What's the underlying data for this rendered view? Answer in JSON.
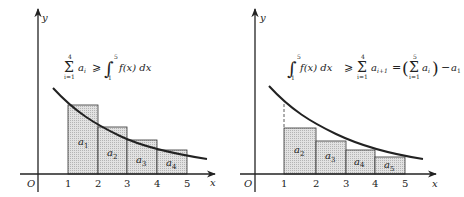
{
  "colors": {
    "ink": "#222222",
    "fill": "#d8d8d8",
    "background": "#ffffff"
  },
  "left_panel": {
    "axis_labels": {
      "x": "x",
      "y": "y",
      "origin": "O"
    },
    "x_ticks": [
      "1",
      "2",
      "3",
      "4",
      "5"
    ],
    "formula": {
      "sum_upper": "4",
      "sum_lower": "i=1",
      "sum_symbol": "Σ",
      "sum_term": "a",
      "sum_term_sub": "i",
      "relation": "⩾",
      "integral_symbol": "∫",
      "int_upper": "5",
      "int_lower": "1",
      "integrand": "f(x) dx"
    },
    "rectangles": [
      {
        "label": "a",
        "sub": "1"
      },
      {
        "label": "a",
        "sub": "2"
      },
      {
        "label": "a",
        "sub": "3"
      },
      {
        "label": "a",
        "sub": "4"
      }
    ]
  },
  "right_panel": {
    "axis_labels": {
      "x": "x",
      "y": "y",
      "origin": "O"
    },
    "x_ticks": [
      "1",
      "2",
      "3",
      "4",
      "5"
    ],
    "formula": {
      "integral_symbol": "∫",
      "int_upper": "5",
      "int_lower": "1",
      "integrand": "f(x) dx",
      "relation": "⩾",
      "sum1_symbol": "Σ",
      "sum1_upper": "4",
      "sum1_lower": "i=1",
      "sum1_term": "a",
      "sum1_term_sub": "i+1",
      "equals": "=",
      "lparen": "(",
      "sum2_symbol": "Σ",
      "sum2_upper": "5",
      "sum2_lower": "i=1",
      "sum2_term": "a",
      "sum2_term_sub": "i",
      "rparen": ")",
      "minus": "−",
      "last_term": "a",
      "last_term_sub": "1"
    },
    "rectangles": [
      {
        "label": "a",
        "sub": "2"
      },
      {
        "label": "a",
        "sub": "3"
      },
      {
        "label": "a",
        "sub": "4"
      },
      {
        "label": "a",
        "sub": "5"
      }
    ]
  }
}
